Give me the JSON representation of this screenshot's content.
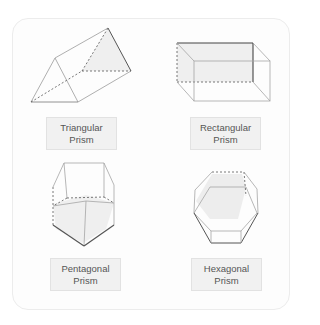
{
  "shapes": [
    {
      "name": "triangular-prism",
      "line1": "Triangular",
      "line2": "Prism"
    },
    {
      "name": "rectangular-prism",
      "line1": "Rectangular",
      "line2": "Prism"
    },
    {
      "name": "pentagonal-prism",
      "line1": "Pentagonal",
      "line2": "Prism"
    },
    {
      "name": "hexagonal-prism",
      "line1": "Hexagonal",
      "line2": "Prism"
    }
  ],
  "colors": {
    "edge": "#8a8a8a",
    "edge_dark": "#555555",
    "shade": "#ededed",
    "label_bg": "#f1f1f1",
    "label_border": "#e2e2e2",
    "label_text": "#555555"
  }
}
